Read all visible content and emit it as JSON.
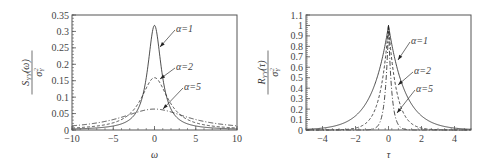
{
  "chart_data": [
    {
      "type": "line",
      "title": "",
      "xlabel": "ω",
      "ylabel": "S_YY(ω) / σ_Y²",
      "ylabel_num": "S",
      "ylabel_num_sub": "YY",
      "ylabel_num_arg": "(ω)",
      "ylabel_den": "σ",
      "ylabel_den_sub": "Y",
      "ylabel_den_sup": "2",
      "xlim": [
        -10,
        10
      ],
      "ylim": [
        0,
        0.35
      ],
      "xticks": [
        "-10",
        "-5",
        "0",
        "5",
        "10"
      ],
      "yticks": [
        "0",
        "0.05",
        "0.1",
        "0.15",
        "0.2",
        "0.25",
        "0.3",
        "0.35"
      ],
      "grid": false,
      "function": "alpha/(pi*(alpha^2+omega^2))",
      "series": [
        {
          "name": "α=1",
          "alpha": 1,
          "style": "solid",
          "peak": 0.318
        },
        {
          "name": "α=2",
          "alpha": 2,
          "style": "dashed",
          "peak": 0.159
        },
        {
          "name": "α=5",
          "alpha": 5,
          "style": "dashdot",
          "peak": 0.064
        }
      ],
      "annotations": [
        "α=1",
        "α=2",
        "α=5"
      ]
    },
    {
      "type": "line",
      "title": "",
      "xlabel": "τ",
      "ylabel": "R_YY(τ) / σ_Y²",
      "ylabel_num": "R",
      "ylabel_num_sub": "YY",
      "ylabel_num_arg": "(τ)",
      "ylabel_den": "σ",
      "ylabel_den_sub": "Y",
      "ylabel_den_sup": "2",
      "xlim": [
        -5,
        5
      ],
      "ylim": [
        0,
        1.1
      ],
      "xticks": [
        "-4",
        "-2",
        "0",
        "2",
        "4"
      ],
      "yticks": [
        "0",
        "0.1",
        "0.2",
        "0.3",
        "0.4",
        "0.5",
        "0.6",
        "0.7",
        "0.8",
        "0.9",
        "1",
        "1.1"
      ],
      "grid": false,
      "function": "exp(-alpha*|tau|)",
      "series": [
        {
          "name": "α=1",
          "alpha": 1,
          "style": "solid",
          "peak": 1.0
        },
        {
          "name": "α=2",
          "alpha": 2,
          "style": "dashed",
          "peak": 1.0
        },
        {
          "name": "α=5",
          "alpha": 5,
          "style": "dashdot",
          "peak": 1.0
        }
      ],
      "annotations": [
        "α=1",
        "α=2",
        "α=5"
      ]
    }
  ]
}
